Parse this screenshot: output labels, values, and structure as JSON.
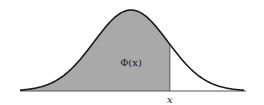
{
  "chart_data": {
    "type": "area",
    "title": "",
    "curve": "normal-pdf",
    "shaded_region": "left-of-x",
    "annotations": {
      "area_label": "Φ(x)",
      "x_marker_label": "x"
    },
    "xlabel": "",
    "ylabel": "",
    "grid": false,
    "legend": null,
    "marker_z": 1.05,
    "range_sigma": [
      -3,
      3
    ]
  },
  "colors": {
    "fill": "#a9a9a9",
    "curve": "#1a1a1a",
    "axis": "#555555",
    "background": "#ffffff"
  },
  "geometry": {
    "mu_px": 131,
    "sigma_px": 37,
    "base_y": 91,
    "peak_y": 10,
    "x_start": 20,
    "x_end": 244,
    "axis_x_start": 20,
    "axis_x_end": 246
  }
}
